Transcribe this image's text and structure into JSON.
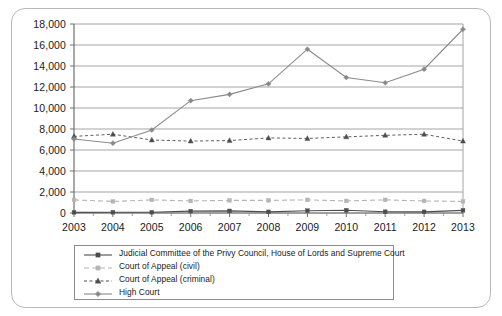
{
  "chart_data": {
    "type": "line",
    "title": "",
    "xlabel": "",
    "ylabel": "",
    "x": [
      2003,
      2004,
      2005,
      2006,
      2007,
      2008,
      2009,
      2010,
      2011,
      2012,
      2013
    ],
    "categories": [
      "2003",
      "2004",
      "2005",
      "2006",
      "2007",
      "2008",
      "2009",
      "2010",
      "2011",
      "2012",
      "2013"
    ],
    "ylim": [
      0,
      18000
    ],
    "ytick_values": [
      0,
      2000,
      4000,
      6000,
      8000,
      10000,
      12000,
      14000,
      16000,
      18000
    ],
    "ytick_labels": [
      "0",
      "2,000",
      "4,000",
      "6,000",
      "8,000",
      "10,000",
      "12,000",
      "14,000",
      "16,000",
      "18,000"
    ],
    "grid": true,
    "legend_position": "bottom-left",
    "series": [
      {
        "name": "Judicial Committee of the Privy Council, House of Lords and Supreme Court",
        "values": [
          60,
          70,
          70,
          180,
          200,
          110,
          220,
          260,
          120,
          110,
          250
        ],
        "color": "#4d4d4d",
        "marker": "square",
        "dash": "solid"
      },
      {
        "name": "Court of Appeal (civil)",
        "values": [
          1250,
          1100,
          1250,
          1150,
          1200,
          1200,
          1250,
          1150,
          1250,
          1150,
          1100
        ],
        "color": "#b5b5b5",
        "marker": "square",
        "dash": "dashed"
      },
      {
        "name": "Court of Appeal (criminal)",
        "values": [
          7300,
          7500,
          6950,
          6850,
          6900,
          7150,
          7100,
          7250,
          7400,
          7500,
          6850
        ],
        "color": "#4d4d4d",
        "marker": "triangle",
        "dash": "dotted"
      },
      {
        "name": "High Court",
        "values": [
          7050,
          6650,
          7900,
          10700,
          11300,
          12300,
          15600,
          12900,
          12400,
          13700,
          17500
        ],
        "color": "#8a8a8a",
        "marker": "diamond",
        "dash": "solid"
      }
    ]
  },
  "legend": {
    "items": [
      {
        "label": "Judicial Committee of the Privy Council, House of Lords and Supreme Court"
      },
      {
        "label": "Court of Appeal (civil)"
      },
      {
        "label": "Court of Appeal (criminal)"
      },
      {
        "label": "High Court"
      }
    ]
  }
}
